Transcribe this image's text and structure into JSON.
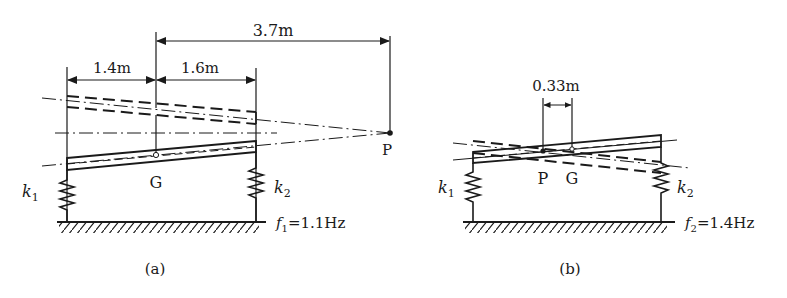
{
  "figure_a": {
    "caption": "(a)",
    "dim_total": "3.7m",
    "dim_left": "1.4m",
    "dim_right": "1.6m",
    "point_p": "P",
    "point_g": "G",
    "spring_left": "k",
    "spring_left_sub": "1",
    "spring_right": "k",
    "spring_right_sub": "2",
    "freq_symbol": "f",
    "freq_sub": "1",
    "freq_value": "=1.1Hz"
  },
  "figure_b": {
    "caption": "(b)",
    "dim_pg": "0.33m",
    "point_p": "P",
    "point_g": "G",
    "spring_left": "k",
    "spring_left_sub": "1",
    "spring_right": "k",
    "spring_right_sub": "2",
    "freq_symbol": "f",
    "freq_sub": "2",
    "freq_value": "=1.4Hz"
  },
  "colors": {
    "ink": "#1a1a1a",
    "background": "#ffffff"
  }
}
